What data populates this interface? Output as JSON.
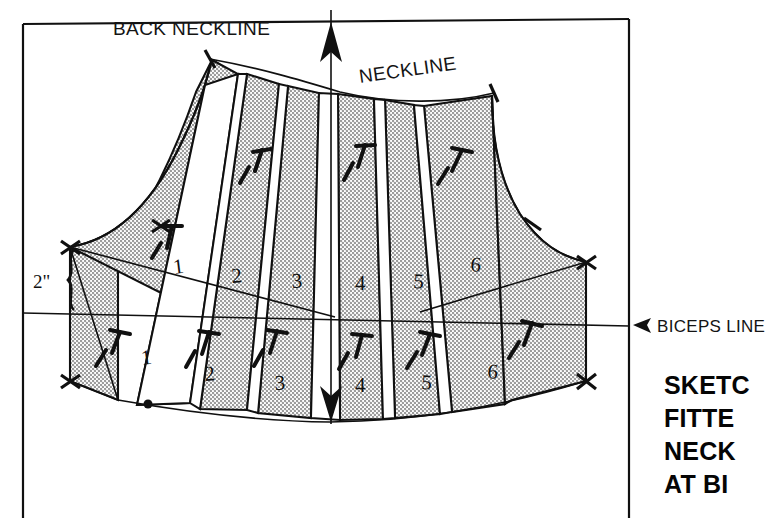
{
  "diagram": {
    "title_caption": {
      "lines": [
        "SKETC",
        "FITTE",
        "NECK",
        "AT BI"
      ]
    },
    "labels": {
      "back_neckline": "BACK NECKLINE",
      "neckline": "NECKLINE",
      "biceps_line": "BICEPS LINE",
      "measurement_2in": "2\""
    },
    "upper_segment_numbers": [
      "1",
      "2",
      "3",
      "4",
      "5",
      "6"
    ],
    "lower_segment_numbers": [
      "1",
      "2",
      "3",
      "4",
      "5",
      "6"
    ],
    "colors": {
      "ink": "#101010",
      "panel_fill": "#d9d9d9",
      "background": "#ffffff"
    },
    "icons": {
      "grainline_up": "up-arrow-icon",
      "grainline_down": "down-arrow-icon",
      "biceps_pointer": "left-arrow-icon",
      "brace": "curly-brace-icon",
      "pin": "pin-marker-icon",
      "notch": "notch-mark-icon",
      "dot": "dot-marker-icon"
    }
  }
}
